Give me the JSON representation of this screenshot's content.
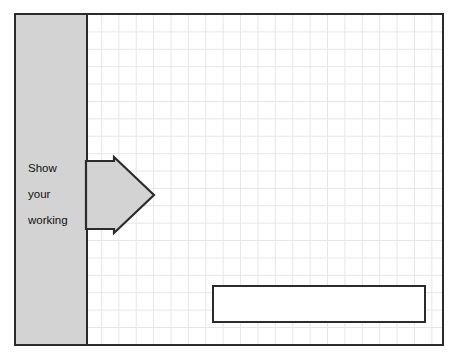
{
  "canvas": {
    "width": 459,
    "height": 361,
    "background_color": "#ffffff"
  },
  "frame": {
    "name": "worksheet-frame",
    "border_color": "#2b2b2b",
    "fill_color": "#ffffff"
  },
  "grid": {
    "name": "graph-paper-grid",
    "line_color": "#e6e6e9",
    "cell_size_px": 17.4,
    "visible": true
  },
  "side_panel": {
    "name": "instruction-panel",
    "fill_color": "#d3d3d3",
    "border_color": "#2b2b2b",
    "text_lines": [
      "Show",
      "your",
      "working"
    ],
    "text_color": "#111111"
  },
  "arrow": {
    "name": "right-pointing-arrow",
    "direction": "right",
    "fill_color": "#d3d3d3",
    "stroke_color": "#2b2b2b"
  },
  "answer_box": {
    "name": "answer-rectangle",
    "fill_color": "#ffffff",
    "border_color": "#2b2b2b",
    "content": ""
  }
}
